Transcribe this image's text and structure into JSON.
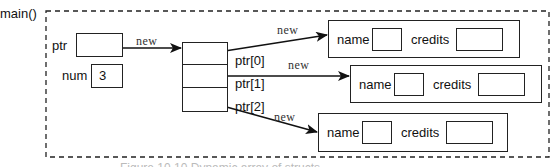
{
  "scope_label": "main()",
  "variables": {
    "ptr": {
      "label": "ptr",
      "value": ""
    },
    "num": {
      "label": "num",
      "value": "3"
    }
  },
  "new_keyword": "new",
  "array": {
    "elements": [
      {
        "label": "ptr[0]"
      },
      {
        "label": "ptr[1]"
      },
      {
        "label": "ptr[2]"
      }
    ]
  },
  "structs": [
    {
      "field1_label": "name",
      "field2_label": "credits",
      "new_label": "new"
    },
    {
      "field1_label": "name",
      "field2_label": "credits",
      "new_label": "new"
    },
    {
      "field1_label": "name",
      "field2_label": "credits",
      "new_label": "new"
    }
  ],
  "caption": "Figure 10.10 Dynamic array of structs"
}
